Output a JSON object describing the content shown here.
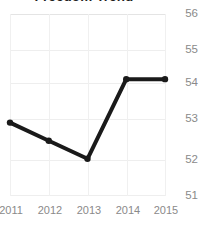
{
  "chart_data": {
    "type": "line",
    "title": "Freedom Trend",
    "xlabel": "",
    "ylabel": "",
    "categories": [
      "2011",
      "2012",
      "2013",
      "2014",
      "2015"
    ],
    "x": [
      2011,
      2012,
      2013,
      2014,
      2015
    ],
    "values": [
      53.0,
      52.5,
      52.0,
      54.2,
      54.2
    ],
    "series": [
      {
        "name": "Freedom Trend",
        "values": [
          53.0,
          52.5,
          52.0,
          54.2,
          54.2
        ]
      }
    ],
    "ylim": [
      51,
      56
    ],
    "xlim": [
      2011,
      2015
    ],
    "yticks": [
      56,
      55,
      54,
      53,
      52,
      51
    ],
    "ytick_labels": [
      "56",
      "55",
      "54",
      "53",
      "52",
      "51"
    ],
    "xtick_labels": [
      "2011",
      "2012",
      "2013",
      "2014",
      "2015"
    ],
    "grid": true,
    "y_axis_position": "right",
    "legend": false,
    "legend_position": "none",
    "markers": "circle",
    "line_color": "#1a1a1a",
    "marker_color": "#1a1a1a",
    "grid_color": "#eeeeee",
    "tick_label_color": "#8a8a8a",
    "title_color": "#1f1f1f",
    "background_color": "#ffffff",
    "line_width": 4
  }
}
